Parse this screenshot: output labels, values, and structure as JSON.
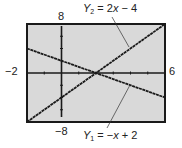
{
  "chart_data": {
    "type": "line",
    "title": "",
    "window": {
      "xmin": -2,
      "xmax": 6,
      "ymin": -8,
      "ymax": 8,
      "xscl": 1,
      "yscl": 2
    },
    "tick_labels": {
      "xmin": "−2",
      "xmax": "6",
      "ymin": "−8",
      "ymax": "8"
    },
    "series": [
      {
        "name": "Y1",
        "equation": "Y1 = −x + 2",
        "slope": -1,
        "intercept": 2,
        "x": [
          -2,
          6
        ],
        "y": [
          4,
          -4
        ]
      },
      {
        "name": "Y2",
        "equation": "Y2 = 2x − 4",
        "slope": 2,
        "intercept": -4,
        "x": [
          -2,
          6
        ],
        "y": [
          -8,
          8
        ]
      }
    ],
    "intersection": {
      "x": 2,
      "y": 0
    },
    "annotations": [
      "Y2 = 2x − 4",
      "Y1 = −x + 2"
    ],
    "grid": false,
    "background": "#d9d9d9",
    "frame_color": "#1a1a1a",
    "line_color": "#1a1a1a"
  },
  "labels": {
    "ymax": "8",
    "ymin": "−8",
    "xmin": "−2",
    "xmax": "6",
    "y2_prefix": "Y",
    "y2_sub": "2",
    "y2_rest": " = 2",
    "y2_var": "x",
    "y2_tail": " − 4",
    "y1_prefix": "Y",
    "y1_sub": "1",
    "y1_rest": " = −",
    "y1_var": "x",
    "y1_tail": " + 2"
  }
}
